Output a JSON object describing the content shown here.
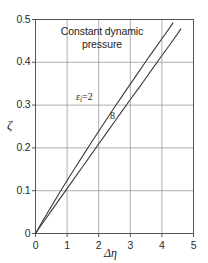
{
  "chart_data": {
    "type": "line",
    "title": "Constant dynamic\npressure",
    "xlabel": "Δη",
    "ylabel": "ζ",
    "xlim": [
      0,
      5
    ],
    "ylim": [
      0,
      0.5
    ],
    "grid": true,
    "legend_position": "inline-curve-labels",
    "xticks": [
      "0",
      "1",
      "2",
      "3",
      "4",
      "5"
    ],
    "xtick_values": [
      0,
      1,
      2,
      3,
      4,
      5
    ],
    "yticks": [
      "0",
      "0.1",
      "0.2",
      "0.3",
      "0.4",
      "0.5"
    ],
    "ytick_values": [
      0,
      0.1,
      0.2,
      0.3,
      0.4,
      0.5
    ],
    "series": [
      {
        "name": "εi = 2",
        "label_prefix": "ε",
        "label_sub": "i",
        "label_eq": "=",
        "label_value": "2",
        "color": "#3a3a3a",
        "x": [
          0,
          0.25,
          0.5,
          0.75,
          1.0,
          1.25,
          1.5,
          1.75,
          2.0,
          2.25,
          2.5,
          2.75,
          3.0,
          3.25,
          3.5,
          3.75,
          4.0,
          4.25,
          4.35
        ],
        "y": [
          0,
          0.032,
          0.063,
          0.094,
          0.124,
          0.153,
          0.182,
          0.211,
          0.239,
          0.267,
          0.295,
          0.322,
          0.349,
          0.376,
          0.403,
          0.429,
          0.455,
          0.481,
          0.492
        ]
      },
      {
        "name": "8",
        "label_value": "8",
        "color": "#3a3a3a",
        "x": [
          0,
          0.25,
          0.5,
          0.75,
          1.0,
          1.25,
          1.5,
          1.75,
          2.0,
          2.25,
          2.5,
          2.75,
          3.0,
          3.25,
          3.5,
          3.75,
          4.0,
          4.25,
          4.5,
          4.6
        ],
        "y": [
          0,
          0.027,
          0.053,
          0.079,
          0.105,
          0.131,
          0.157,
          0.183,
          0.209,
          0.235,
          0.261,
          0.287,
          0.313,
          0.338,
          0.364,
          0.39,
          0.416,
          0.441,
          0.467,
          0.478
        ]
      }
    ],
    "colors": {
      "frame": "#555555",
      "grid": "#8c8c8c",
      "curve": "#3a3a3a",
      "text": "#1c1c1c",
      "background": "#ffffff"
    }
  }
}
